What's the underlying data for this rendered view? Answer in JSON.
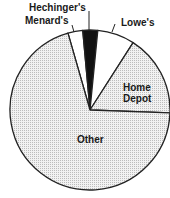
{
  "chart_data": {
    "type": "pie",
    "title": "",
    "start_angle_deg": -16,
    "direction": "clockwise",
    "slices": [
      {
        "label": "Menard's",
        "value": 3,
        "fill": "#ffffff",
        "pattern": "none"
      },
      {
        "label": "Hechinger's",
        "value": 3,
        "fill": "#111111",
        "pattern": "solid"
      },
      {
        "label": "Lowe's",
        "value": 7.5,
        "fill": "#ffffff",
        "pattern": "none"
      },
      {
        "label": "Home Depot",
        "value": 16.5,
        "fill": "#e6e6e6",
        "pattern": "dotted"
      },
      {
        "label": "Other",
        "value": 70,
        "fill": "#ececec",
        "pattern": "dotted"
      }
    ],
    "categories": [
      "Menard's",
      "Hechinger's",
      "Lowe's",
      "Home Depot",
      "Other"
    ],
    "values": [
      3,
      3,
      7.5,
      16.5,
      70
    ],
    "legend": "none (direct labels)",
    "value_units": "percent (estimated from angles)"
  },
  "labels": {
    "hechinger": "Hechinger's",
    "menard": "Menard's",
    "lowes": "Lowe's",
    "homedepot_line1": "Home",
    "homedepot_line2": "Depot",
    "other": "Other"
  }
}
